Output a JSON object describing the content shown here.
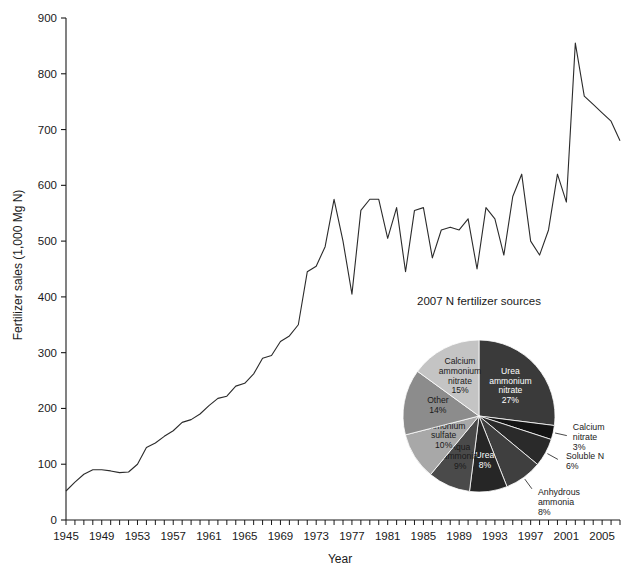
{
  "chart_data": [
    {
      "type": "line",
      "title": "",
      "xlabel": "Year",
      "ylabel": "Fertilizer sales (1,000 Mg N)",
      "xlim": [
        1945,
        2007
      ],
      "ylim": [
        0,
        900
      ],
      "ytick_labels": [
        "0",
        "100",
        "200",
        "300",
        "400",
        "500",
        "600",
        "700",
        "800",
        "900"
      ],
      "yticks": [
        0,
        100,
        200,
        300,
        400,
        500,
        600,
        700,
        800,
        900
      ],
      "xtick_labels": [
        "1945",
        "1949",
        "1953",
        "1957",
        "1961",
        "1965",
        "1969",
        "1973",
        "1977",
        "1981",
        "1985",
        "1989",
        "1993",
        "1997",
        "2001",
        "2005"
      ],
      "xticks": [
        1945,
        1949,
        1953,
        1957,
        1961,
        1965,
        1969,
        1973,
        1977,
        1981,
        1985,
        1989,
        1993,
        1997,
        2001,
        2005
      ],
      "minor_xtick_interval": 1,
      "grid": false,
      "legend": "none",
      "line_color": "#2b2b2b",
      "x": [
        1945,
        1946,
        1947,
        1948,
        1949,
        1950,
        1951,
        1952,
        1953,
        1954,
        1955,
        1956,
        1957,
        1958,
        1959,
        1960,
        1961,
        1962,
        1963,
        1964,
        1965,
        1966,
        1967,
        1968,
        1969,
        1970,
        1971,
        1972,
        1973,
        1974,
        1975,
        1976,
        1977,
        1978,
        1979,
        1980,
        1981,
        1982,
        1983,
        1984,
        1985,
        1986,
        1987,
        1988,
        1989,
        1990,
        1991,
        1992,
        1993,
        1994,
        1995,
        1996,
        1997,
        1998,
        1999,
        2000,
        2001,
        2002,
        2003,
        2004,
        2005,
        2006,
        2007
      ],
      "values": [
        52,
        68,
        82,
        90,
        90,
        88,
        85,
        86,
        100,
        130,
        138,
        150,
        160,
        175,
        180,
        190,
        205,
        218,
        222,
        240,
        245,
        262,
        290,
        295,
        320,
        330,
        350,
        445,
        455,
        490,
        575,
        500,
        405,
        555,
        575,
        575,
        505,
        560,
        445,
        555,
        560,
        470,
        520,
        525,
        520,
        540,
        450,
        560,
        540,
        475,
        580,
        620,
        500,
        475,
        520,
        620,
        570,
        855,
        760,
        745,
        730,
        715,
        680
      ]
    },
    {
      "type": "pie",
      "title": "2007 N fertilizer sources",
      "legend": "labels-on-slices",
      "labels": [
        "Urea ammonium nitrate",
        "Calcium nitrate",
        "Soluble N",
        "Anhydrous ammonia",
        "Urea",
        "Aqua ammonia",
        "Ammonium sulfate",
        "Other",
        "Calcium ammonium nitrate"
      ],
      "values": [
        27,
        3,
        6,
        8,
        8,
        9,
        10,
        14,
        15
      ],
      "value_suffix": "%",
      "slice_labels": [
        {
          "name": "Urea ammonium nitrate",
          "percent": "27%",
          "placement": "inside",
          "color": "#3a3a3a",
          "text_color": "#ffffff"
        },
        {
          "name": "Calcium nitrate",
          "percent": "3%",
          "placement": "outside",
          "color": "#141414",
          "text_color": "#1a1a1a"
        },
        {
          "name": "Soluble N",
          "percent": "6%",
          "placement": "outside",
          "color": "#2a2a2a",
          "text_color": "#1a1a1a"
        },
        {
          "name": "Anhydrous ammonia",
          "percent": "8%",
          "placement": "outside",
          "color": "#3f3f3f",
          "text_color": "#1a1a1a"
        },
        {
          "name": "Urea",
          "percent": "8%",
          "placement": "inside",
          "color": "#262626",
          "text_color": "#ffffff"
        },
        {
          "name": "Aqua ammonia",
          "percent": "9%",
          "placement": "inside",
          "color": "#4a4a4a",
          "text_color": "#1a1a1a"
        },
        {
          "name": "Ammonium sulfate",
          "percent": "10%",
          "placement": "inside",
          "color": "#a8a8a8",
          "text_color": "#1a1a1a"
        },
        {
          "name": "Other",
          "percent": "14%",
          "placement": "inside",
          "color": "#8c8c8c",
          "text_color": "#1a1a1a"
        },
        {
          "name": "Calcium ammonium nitrate",
          "percent": "15%",
          "placement": "inside",
          "color": "#c4c4c4",
          "text_color": "#1a1a1a"
        }
      ]
    }
  ]
}
